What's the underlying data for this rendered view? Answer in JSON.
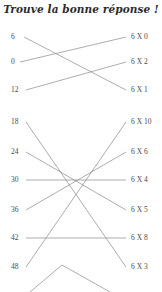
{
  "page": {
    "title": "Trouve la bonne réponse !",
    "background_color": "#ffffff",
    "line_color": "#8a8a8a",
    "text_color": "#4a4a4a"
  },
  "groups": [
    {
      "id": "group-1",
      "left_items": [
        {
          "label": "6",
          "x": 11,
          "y": 37
        },
        {
          "label": "0",
          "x": 11,
          "y": 62
        },
        {
          "label": "12",
          "x": 11,
          "y": 90
        }
      ],
      "right_items": [
        {
          "label": "6 X 0",
          "x": 131,
          "y": 37
        },
        {
          "label": "6 X 2",
          "x": 131,
          "y": 62
        },
        {
          "label": "6 X 1",
          "x": 131,
          "y": 90
        }
      ],
      "connections": [
        {
          "from": "6",
          "to": "6 X 1",
          "x1": 24,
          "y1": 37,
          "x2": 126,
          "y2": 90
        },
        {
          "from": "0",
          "to": "6 X 0",
          "x1": 20,
          "y1": 62,
          "x2": 126,
          "y2": 37
        },
        {
          "from": "12",
          "to": "6 X 2",
          "x1": 26,
          "y1": 90,
          "x2": 126,
          "y2": 62
        }
      ]
    },
    {
      "id": "group-2",
      "left_items": [
        {
          "label": "18",
          "x": 11,
          "y": 122
        },
        {
          "label": "24",
          "x": 11,
          "y": 152
        },
        {
          "label": "30",
          "x": 11,
          "y": 180
        },
        {
          "label": "36",
          "x": 11,
          "y": 210
        },
        {
          "label": "42",
          "x": 11,
          "y": 238
        },
        {
          "label": "48",
          "x": 11,
          "y": 267
        }
      ],
      "right_items": [
        {
          "label": "6 X 10",
          "x": 131,
          "y": 122
        },
        {
          "label": "6 X 6",
          "x": 131,
          "y": 152
        },
        {
          "label": "6 X 4",
          "x": 131,
          "y": 180
        },
        {
          "label": "6 X 5",
          "x": 131,
          "y": 210
        },
        {
          "label": "6 X 8",
          "x": 131,
          "y": 238
        },
        {
          "label": "6 X 3",
          "x": 131,
          "y": 267
        }
      ],
      "connections": [
        {
          "from": "18",
          "to": "6 X 3",
          "x1": 26,
          "y1": 122,
          "x2": 126,
          "y2": 267
        },
        {
          "from": "24",
          "to": "6 X 5",
          "x1": 26,
          "y1": 152,
          "x2": 126,
          "y2": 210
        },
        {
          "from": "30",
          "to": "6 X 4",
          "x1": 26,
          "y1": 180,
          "x2": 126,
          "y2": 180
        },
        {
          "from": "36",
          "to": "6 X 6",
          "x1": 26,
          "y1": 210,
          "x2": 126,
          "y2": 152
        },
        {
          "from": "42",
          "to": "6 X 8",
          "x1": 26,
          "y1": 238,
          "x2": 126,
          "y2": 238
        },
        {
          "from": "48",
          "to": "6 X 10",
          "x1": 26,
          "y1": 267,
          "x2": 126,
          "y2": 122
        },
        {
          "from": "",
          "to": "",
          "x1": 62,
          "y1": 265,
          "x2": 110,
          "y2": 292
        },
        {
          "from": "",
          "to": "",
          "x1": 62,
          "y1": 265,
          "x2": 30,
          "y2": 292
        }
      ]
    }
  ]
}
